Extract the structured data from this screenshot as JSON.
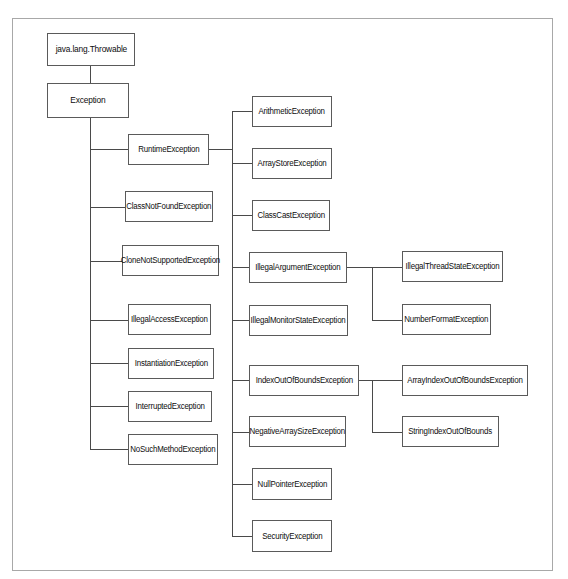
{
  "diagram": {
    "background_color": "#ffffff",
    "frame_color": "#a8a8a8",
    "box_border_color": "#5a5a5a",
    "line_color": "#4a4a4a",
    "text_color": "#0d0d0d"
  },
  "nodes": {
    "throwable": {
      "label": "java.lang.Throwable"
    },
    "exception": {
      "label": "Exception"
    },
    "runtime": {
      "label": "RuntimeException"
    },
    "class_not_found": {
      "label": "ClassNotFoundException"
    },
    "clone_not_supported": {
      "label": "CloneNotSupportedException"
    },
    "illegal_access": {
      "label": "IllegalAccessException"
    },
    "instantiation": {
      "label": "InstantiationException"
    },
    "interrupted": {
      "label": "InterruptedException"
    },
    "no_such_method": {
      "label": "NoSuchMethodException"
    },
    "arithmetic": {
      "label": "ArithmeticException"
    },
    "array_store": {
      "label": "ArrayStoreException"
    },
    "class_cast": {
      "label": "ClassCastException"
    },
    "illegal_argument": {
      "label": "IllegalArgumentException"
    },
    "illegal_monitor_state": {
      "label": "IllegalMonitorStateException"
    },
    "index_out_of_bounds": {
      "label": "IndexOutOfBoundsException"
    },
    "negative_array_size": {
      "label": "NegativeArraySizeException"
    },
    "null_pointer": {
      "label": "NullPointerException"
    },
    "security": {
      "label": "SecurityException"
    },
    "illegal_thread_state": {
      "label": "IllegalThreadStateException"
    },
    "number_format": {
      "label": "NumberFormatException"
    },
    "array_index_out_of_bounds": {
      "label": "ArrayIndexOutOfBoundsException"
    },
    "string_index_out_of_bounds": {
      "label": "StringIndexOutOfBounds"
    }
  },
  "edges": [
    {
      "from": "throwable",
      "to": "exception"
    },
    {
      "from": "exception",
      "to": "runtime"
    },
    {
      "from": "exception",
      "to": "class_not_found"
    },
    {
      "from": "exception",
      "to": "clone_not_supported"
    },
    {
      "from": "exception",
      "to": "illegal_access"
    },
    {
      "from": "exception",
      "to": "instantiation"
    },
    {
      "from": "exception",
      "to": "interrupted"
    },
    {
      "from": "exception",
      "to": "no_such_method"
    },
    {
      "from": "runtime",
      "to": "arithmetic"
    },
    {
      "from": "runtime",
      "to": "array_store"
    },
    {
      "from": "runtime",
      "to": "class_cast"
    },
    {
      "from": "runtime",
      "to": "illegal_argument"
    },
    {
      "from": "runtime",
      "to": "illegal_monitor_state"
    },
    {
      "from": "runtime",
      "to": "index_out_of_bounds"
    },
    {
      "from": "runtime",
      "to": "negative_array_size"
    },
    {
      "from": "runtime",
      "to": "null_pointer"
    },
    {
      "from": "runtime",
      "to": "security"
    },
    {
      "from": "illegal_argument",
      "to": "illegal_thread_state"
    },
    {
      "from": "illegal_argument",
      "to": "number_format"
    },
    {
      "from": "index_out_of_bounds",
      "to": "array_index_out_of_bounds"
    },
    {
      "from": "index_out_of_bounds",
      "to": "string_index_out_of_bounds"
    }
  ]
}
